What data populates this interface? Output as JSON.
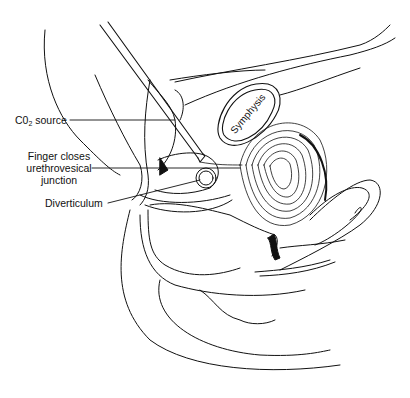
{
  "diagram": {
    "type": "anatomical-illustration",
    "style": "black line drawing on white",
    "colors": {
      "background": "#ffffff",
      "ink": "#111111"
    },
    "labels": {
      "co2_source": {
        "main": "C0",
        "sub": "2",
        "rest": " source"
      },
      "finger_line1": "Finger closes",
      "finger_line2": "urethrovesical",
      "finger_line3": "junction",
      "diverticulum": "Diverticulum",
      "symphysis": "Symphysis"
    }
  }
}
